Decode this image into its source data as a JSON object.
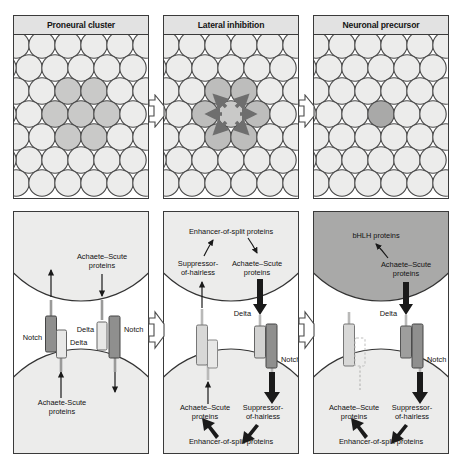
{
  "figure": {
    "colors": {
      "panel_border": "#3a3a3a",
      "header_bg": "#e2e2e2",
      "cell_light": "#ececeb",
      "cell_mid": "#d3d3d2",
      "cell_dark": "#a9a9a8",
      "cell_outline": "#4a4a4a",
      "notch_dark": "#8f8f8e",
      "notch_light": "#d8d8d7",
      "delta_light": "#e8e8e7",
      "arrow_dark": "#1a1a1a",
      "arrow_gray": "#6e6e6e",
      "tween_arrow_fill": "#ffffff",
      "tween_arrow_stroke": "#4a4a4a"
    }
  },
  "top_panels": [
    {
      "id": "proneural-cluster",
      "title": "Proneural cluster",
      "description": "Epithelial sheet with a cluster of cells expressing proneural genes",
      "rows": 7,
      "columns": 5,
      "highlighted_cells": 7,
      "shading": "cluster of mid-gray cells in centre",
      "arrows": []
    },
    {
      "id": "lateral-inhibition",
      "title": "Lateral inhibition",
      "description": "Central cell signals outward to inhibit its neighbours",
      "rows": 7,
      "columns": 5,
      "highlighted_cells": 7,
      "shading": "cluster of mid-gray cells with darker centre",
      "arrows": [
        "up-left",
        "up-right",
        "left",
        "right",
        "down-left",
        "down-right"
      ]
    },
    {
      "id": "neuronal-precursor",
      "title": "Neuronal precursor",
      "description": "A single cell remains dark and becomes the neuronal precursor",
      "rows": 7,
      "columns": 5,
      "highlighted_cells": 1,
      "shading": "one dark-gray cell in centre",
      "arrows": []
    }
  ],
  "tween_arrows": [
    {
      "id": "arrow-1-to-2",
      "direction": "right"
    },
    {
      "id": "arrow-2-to-3",
      "direction": "right"
    }
  ],
  "bottom_panels": [
    {
      "id": "mechanism-equivalent-cells",
      "cells": [
        {
          "position": "upper",
          "fill": "light",
          "labels": [
            {
              "text": "Achaete–Scute",
              "sub": "proteins",
              "name": "achaete-scute-label-upper"
            }
          ]
        },
        {
          "position": "lower",
          "fill": "light",
          "labels": [
            {
              "text": "Achaete-Scute",
              "sub": "proteins",
              "name": "achaete-scute-label-lower"
            }
          ]
        }
      ],
      "membrane_proteins": [
        {
          "name": "Notch",
          "side": "left",
          "shade": "dark"
        },
        {
          "name": "Delta",
          "side": "left",
          "shade": "light"
        },
        {
          "name": "Delta",
          "side": "right",
          "shade": "light"
        },
        {
          "name": "Notch",
          "side": "right",
          "shade": "dark"
        }
      ],
      "arrows": [
        {
          "from": "membrane-left",
          "to": "upper-cell",
          "weight": "thin",
          "dashed": true
        },
        {
          "from": "upper-cell",
          "to": "membrane-right",
          "weight": "thin",
          "dashed": false
        },
        {
          "from": "lower-cell",
          "to": "membrane-left",
          "weight": "thin",
          "dashed": false
        },
        {
          "from": "membrane-right",
          "to": "lower-cell",
          "weight": "thin",
          "dashed": true
        }
      ]
    },
    {
      "id": "mechanism-lateral-inhibition",
      "cells": [
        {
          "position": "upper",
          "fill": "light",
          "labels": [
            {
              "text": "Enhancer-of-split proteins",
              "name": "enhancer-of-split-label-upper"
            },
            {
              "text": "Suppressor-",
              "sub": "of-hairless",
              "name": "suppressor-of-hairless-label-upper"
            },
            {
              "text": "Achaete–Scute",
              "sub": "proteins",
              "name": "achaete-scute-label-upper"
            }
          ]
        },
        {
          "position": "lower",
          "fill": "light",
          "labels": [
            {
              "text": "Achaete–Scute",
              "sub": "proteins",
              "name": "achaete-scute-label-lower"
            },
            {
              "text": "Suppressor-",
              "sub": "of-hairless",
              "name": "suppressor-of-hairless-label-lower"
            },
            {
              "text": "Enhancer-of-split proteins",
              "name": "enhancer-of-split-label-lower"
            }
          ]
        }
      ],
      "membrane_proteins": [
        {
          "name": "Delta",
          "side": "right-upper",
          "shade": "light"
        },
        {
          "name": "Notch",
          "side": "right",
          "shade": "dark"
        }
      ],
      "arrows": [
        {
          "from": "suppressor-upper",
          "to": "enhancer-upper",
          "weight": "thin"
        },
        {
          "from": "enhancer-upper",
          "to": "achaete-upper",
          "weight": "thin",
          "style": "inhibit"
        },
        {
          "from": "achaete-upper",
          "to": "delta",
          "weight": "thick"
        },
        {
          "from": "notch",
          "to": "suppressor-lower",
          "weight": "thick"
        },
        {
          "from": "suppressor-lower",
          "to": "enhancer-lower",
          "weight": "thick"
        },
        {
          "from": "enhancer-lower",
          "to": "achaete-lower",
          "weight": "thick"
        }
      ]
    },
    {
      "id": "mechanism-neuronal-precursor",
      "cells": [
        {
          "position": "upper",
          "fill": "dark",
          "labels": [
            {
              "text": "bHLH proteins",
              "name": "bhlh-proteins-label"
            },
            {
              "text": "Achaete–Scute",
              "sub": "proteins",
              "name": "achaete-scute-label-upper"
            }
          ]
        },
        {
          "position": "lower",
          "fill": "light",
          "labels": [
            {
              "text": "Achaete–Scute",
              "sub": "proteins",
              "name": "achaete-scute-label-lower"
            },
            {
              "text": "Suppressor-",
              "sub": "of-hairless",
              "name": "suppressor-of-hairless-label-lower"
            },
            {
              "text": "Enhancer-of-split proteins",
              "name": "enhancer-of-split-label-lower"
            }
          ]
        }
      ],
      "membrane_proteins": [
        {
          "name": "Notch",
          "side": "left",
          "shade": "light"
        },
        {
          "name": "Delta",
          "side": "left",
          "shade": "inactive-dashed"
        },
        {
          "name": "Delta",
          "side": "right",
          "shade": "mid"
        },
        {
          "name": "Notch",
          "side": "right",
          "shade": "dark"
        }
      ],
      "labels_membrane": [
        {
          "text": "Delta",
          "name": "delta-label"
        },
        {
          "text": "Notch",
          "name": "notch-label"
        }
      ],
      "arrows": [
        {
          "from": "achaete-upper",
          "to": "bhlh",
          "weight": "thin"
        },
        {
          "from": "achaete-upper",
          "to": "delta",
          "weight": "thick"
        },
        {
          "from": "notch",
          "to": "suppressor-lower",
          "weight": "thick"
        },
        {
          "from": "suppressor-lower",
          "to": "enhancer-lower",
          "weight": "thick"
        },
        {
          "from": "enhancer-lower",
          "to": "achaete-lower",
          "weight": "thick"
        }
      ]
    }
  ],
  "labels": {
    "notch": "Notch",
    "delta": "Delta",
    "achaete_scute_1": "Achaete–Scute",
    "achaete_scute_2": "proteins",
    "achaete_scute_plain_1": "Achaete-Scute",
    "suppressor_1": "Suppressor-",
    "suppressor_2": "of-hairless",
    "enhancer": "Enhancer-of-split proteins",
    "bhlh": "bHLH proteins"
  }
}
